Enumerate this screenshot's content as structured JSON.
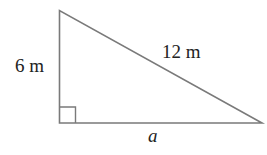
{
  "diagram": {
    "type": "right-triangle",
    "stroke_color": "#7a7a7a",
    "labels": {
      "vertical_leg": "6 m",
      "hypotenuse": "12 m",
      "horizontal_leg": "a"
    },
    "right_angle_marker": true
  }
}
